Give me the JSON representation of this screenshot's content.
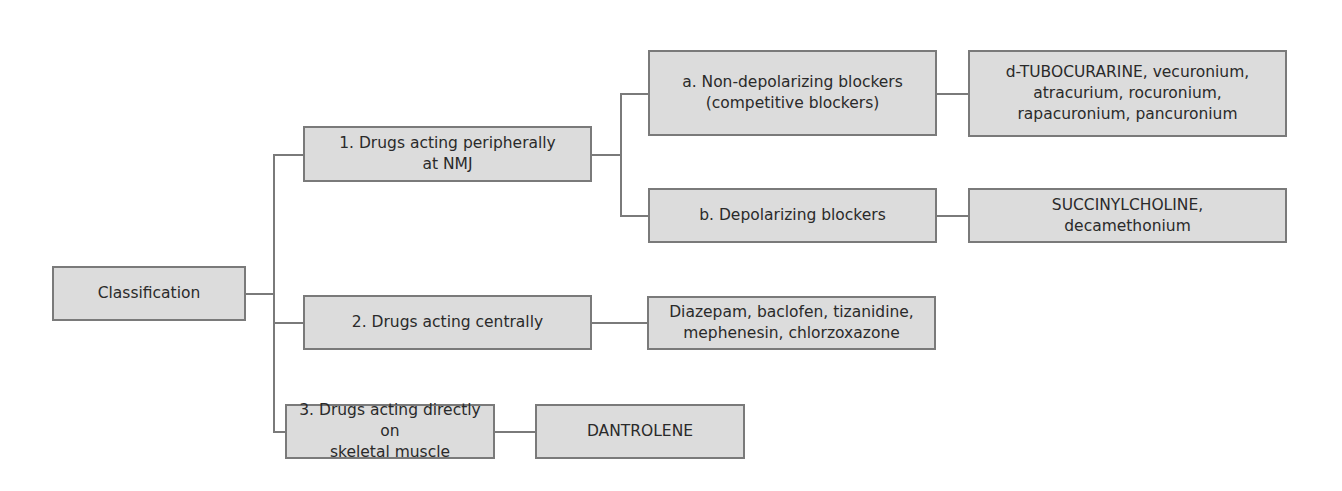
{
  "diagram": {
    "root": {
      "label": "Classification"
    },
    "categories": [
      {
        "label": "1. Drugs acting peripherally\nat NMJ",
        "subcategories": [
          {
            "label": "a. Non-depolarizing blockers\n(competitive blockers)",
            "drugs": "d-TUBOCURARINE, vecuronium,\natracurium, rocuronium,\nrapacuronium, pancuronium"
          },
          {
            "label": "b. Depolarizing blockers",
            "drugs": "SUCCINYLCHOLINE,\ndecamethonium"
          }
        ]
      },
      {
        "label": "2. Drugs acting centrally",
        "drugs": "Diazepam, baclofen, tizanidine,\nmephenesin, chlorzoxazone"
      },
      {
        "label": "3. Drugs acting directly on\nskeletal muscle",
        "drugs": "DANTROLENE"
      }
    ],
    "colors": {
      "box_fill": "#dcdcdc",
      "box_border": "#7a7a7a",
      "line": "#7a7a7a",
      "text": "#2a2a2a"
    }
  }
}
